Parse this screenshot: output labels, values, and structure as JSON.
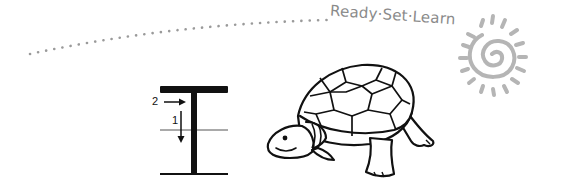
{
  "header": {
    "brand_text": "Ready·Set·Learn",
    "dotted_trail": "decorative-dotted-arc",
    "sun_icon": "spiral-sun-logo"
  },
  "letter_guide": {
    "letter": "T",
    "stroke_order": [
      {
        "step": "1",
        "direction": "down",
        "description": "vertical stroke top to bottom"
      },
      {
        "step": "2",
        "direction": "right",
        "description": "horizontal stroke across top"
      }
    ],
    "guide_lines": [
      "top-line",
      "mid-line",
      "base-line"
    ]
  },
  "illustration": {
    "subject": "turtle",
    "caption": "T is for Turtle"
  },
  "colors": {
    "ink": "#111111",
    "brand_gray": "#8a8a8a",
    "sun_gray": "#b0b0b0",
    "background": "#ffffff"
  }
}
